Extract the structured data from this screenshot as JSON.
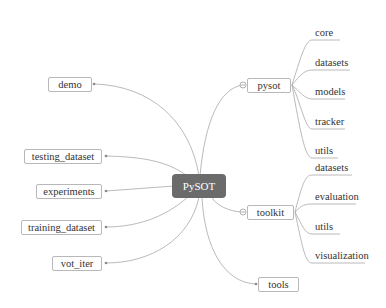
{
  "root": {
    "label": "PySOT"
  },
  "left_nodes": [
    {
      "label": "demo"
    },
    {
      "label": "testing_dataset"
    },
    {
      "label": "experiments"
    },
    {
      "label": "training_dataset"
    },
    {
      "label": "vot_iter"
    }
  ],
  "right_nodes": {
    "pysot": {
      "label": "pysot",
      "children": [
        {
          "label": "core"
        },
        {
          "label": "datasets"
        },
        {
          "label": "models"
        },
        {
          "label": "tracker"
        },
        {
          "label": "utils"
        }
      ]
    },
    "toolkit": {
      "label": "toolkit",
      "children": [
        {
          "label": "datasets"
        },
        {
          "label": "evaluation"
        },
        {
          "label": "utils"
        },
        {
          "label": "visualization"
        }
      ]
    },
    "tools": {
      "label": "tools"
    }
  },
  "colors": {
    "root_fill": "#6b6b6b",
    "edge": "#a8a8a8",
    "node_border": "#b8b8b8"
  }
}
